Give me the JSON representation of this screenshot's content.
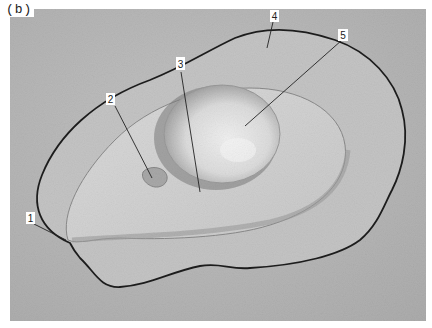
{
  "figure": {
    "panel_label": "(b)",
    "callouts": [
      {
        "id": "1",
        "label": "1"
      },
      {
        "id": "2",
        "label": "2"
      },
      {
        "id": "3",
        "label": "3"
      },
      {
        "id": "4",
        "label": "4"
      },
      {
        "id": "5",
        "label": "5"
      }
    ],
    "colors": {
      "background": "#b9b9b9",
      "outer_albumen": "#c4c4c4",
      "thick_albumen": "#d0d0d0",
      "yolk": "#e2e2e2",
      "outline": "#1e1e1e",
      "label_box": "#ffffff"
    }
  }
}
